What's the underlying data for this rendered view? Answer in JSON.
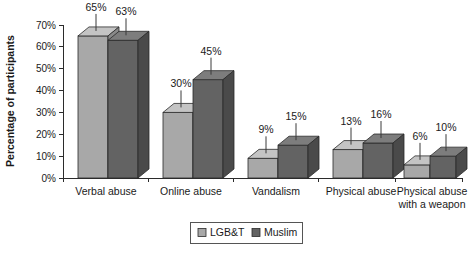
{
  "chart_data": {
    "type": "bar",
    "title": "",
    "subtitle": "",
    "xlabel": "",
    "ylabel": "Percentage of participants",
    "categories": [
      "Verbal abuse",
      "Online abuse",
      "Vandalism",
      "Physical abuse",
      "Physical abuse with a weapon"
    ],
    "category_lines": [
      [
        "Verbal abuse"
      ],
      [
        "Online abuse"
      ],
      [
        "Vandalism"
      ],
      [
        "Physical abuse"
      ],
      [
        "Physical abuse",
        "with a weapon"
      ]
    ],
    "series": [
      {
        "name": "LGB&T",
        "color": "#a8a8a8",
        "top_color": "#c4c4c4",
        "side_color": "#8a8a8a",
        "values": [
          65,
          30,
          9,
          13,
          6
        ],
        "value_labels": [
          "65%",
          "30%",
          "9%",
          "13%",
          "6%"
        ]
      },
      {
        "name": "Muslim",
        "color": "#636363",
        "top_color": "#7d7d7d",
        "side_color": "#4a4a4a",
        "values": [
          63,
          45,
          15,
          16,
          10
        ],
        "value_labels": [
          "63%",
          "45%",
          "15%",
          "16%",
          "10%"
        ]
      }
    ],
    "ylim": [
      0,
      70
    ],
    "ytick_values": [
      0,
      10,
      20,
      30,
      40,
      50,
      60,
      70
    ],
    "ytick_labels": [
      "0%",
      "10%",
      "20%",
      "30%",
      "40%",
      "50%",
      "60%",
      "70%"
    ],
    "grid": false,
    "legend_position": "bottom",
    "legend_entries": [
      "LGB&T",
      "Muslim"
    ],
    "style": "3d-clustered-column",
    "value_labels_shown": true
  }
}
